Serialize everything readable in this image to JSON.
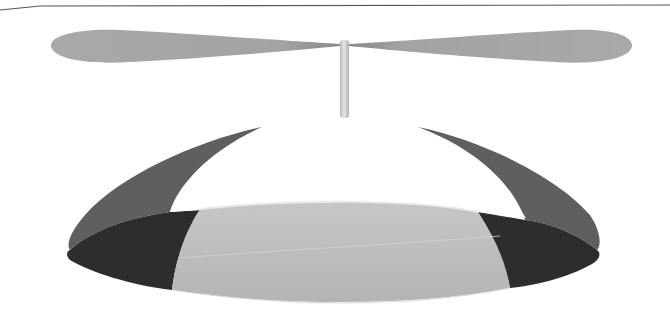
{
  "image": {
    "subject": "propeller beanie cap",
    "description": "Grayscale illustration of a propeller beanie: a two-blade propeller on a thin stem atop a segmented dome cap with alternating white, dark gray, and light gray panels.",
    "colors": {
      "background": "#ffffff",
      "top_rule": "#555555",
      "propeller_blade": "#a8a8a8",
      "stem": "#d6d6d6",
      "panel_white": "#ffffff",
      "panel_side_outer": "#5e5e5e",
      "panel_side_inner": "#2e2e2e",
      "panel_front": "#bdbdbd"
    }
  }
}
